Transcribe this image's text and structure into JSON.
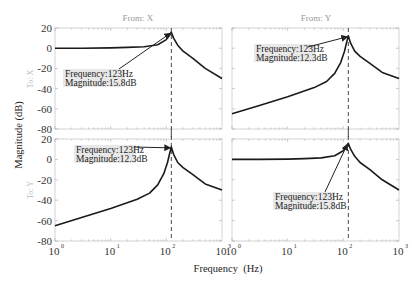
{
  "chart_data": {
    "type": "line",
    "title": "",
    "xlabel": "Frequency  (Hz)",
    "ylabel": "Magnitude (dB)",
    "xscale": "log",
    "xlim": [
      1,
      1000
    ],
    "ylim": [
      -80,
      20
    ],
    "grid": false,
    "column_titles": [
      "From: X",
      "From: Y"
    ],
    "row_labels": [
      "To: X",
      "To: Y"
    ],
    "x_ticks": [
      {
        "base": "10",
        "exp": "0",
        "value": 1
      },
      {
        "base": "10",
        "exp": "1",
        "value": 10
      },
      {
        "base": "10",
        "exp": "2",
        "value": 100
      },
      {
        "base": "10",
        "exp": "3",
        "value": 1000
      }
    ],
    "y_ticks": [
      "20",
      "0",
      "-20",
      "-40",
      "-60",
      "-80"
    ],
    "y_tick_values": [
      20,
      0,
      -20,
      -40,
      -60,
      -80
    ],
    "marker_frequency": 123,
    "panels": [
      {
        "id": "from-x-to-x",
        "row": 0,
        "col": 0,
        "series": {
          "name": "From X to X",
          "x": [
            1,
            3,
            10,
            20,
            40,
            70,
            100,
            115,
            123,
            135,
            160,
            200,
            300,
            500,
            1000
          ],
          "y": [
            0,
            0,
            0.3,
            0.8,
            1.5,
            3.5,
            8.5,
            13,
            15.8,
            10,
            3,
            -3,
            -10,
            -20,
            -30
          ]
        },
        "annotation": {
          "frequency_label": "Frequency:123Hz",
          "magnitude_label": "Magnitude:15.8dB",
          "x": 123,
          "y": 15.8,
          "placement": "left-below"
        }
      },
      {
        "id": "from-y-to-x",
        "row": 0,
        "col": 1,
        "series": {
          "name": "From Y to X",
          "x": [
            1,
            3,
            10,
            30,
            50,
            70,
            90,
            105,
            115,
            123,
            135,
            160,
            200,
            300,
            500,
            1000
          ],
          "y": [
            -65,
            -57,
            -48,
            -39,
            -33,
            -25,
            -14,
            -3,
            6,
            12.3,
            5,
            -3,
            -8,
            -15,
            -24,
            -30
          ]
        },
        "annotation": {
          "frequency_label": "Frequency:123Hz",
          "magnitude_label": "Magnitude:12.3dB",
          "x": 123,
          "y": 12.3,
          "placement": "left-below"
        }
      },
      {
        "id": "from-x-to-y",
        "row": 1,
        "col": 0,
        "series": {
          "name": "From X to Y",
          "x": [
            1,
            3,
            10,
            30,
            50,
            70,
            90,
            105,
            115,
            123,
            135,
            160,
            200,
            300,
            500,
            1000
          ],
          "y": [
            -65,
            -57,
            -48,
            -39,
            -33,
            -25,
            -14,
            -3,
            6,
            12.3,
            5,
            -3,
            -8,
            -15,
            -24,
            -30
          ]
        },
        "annotation": {
          "frequency_label": "Frequency:123Hz",
          "magnitude_label": "Magnitude:12.3dB",
          "x": 123,
          "y": 12.3,
          "placement": "left-below"
        }
      },
      {
        "id": "from-y-to-y",
        "row": 1,
        "col": 1,
        "series": {
          "name": "From Y to Y",
          "x": [
            1,
            3,
            10,
            20,
            40,
            70,
            100,
            115,
            123,
            135,
            160,
            200,
            300,
            500,
            1000
          ],
          "y": [
            0,
            0,
            0.3,
            0.8,
            1.5,
            3.5,
            8.5,
            13,
            15.8,
            10,
            3,
            -3,
            -10,
            -20,
            -30
          ]
        },
        "annotation": {
          "frequency_label": "Frequency:123Hz",
          "magnitude_label": "Magnitude:15.8dB",
          "x": 123,
          "y": 15.8,
          "placement": "left-below-far"
        }
      }
    ]
  }
}
